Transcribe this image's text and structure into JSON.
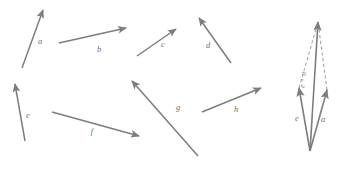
{
  "figure": {
    "stroke_color": "#7d7d7d",
    "dashed_color": "#9a9a9a",
    "label_color": "#6f6f6f",
    "background": "#ffffff",
    "width": 341,
    "height": 169
  },
  "left_panel": {
    "name": "labeled-vectors-group",
    "vectors": [
      {
        "id": "a",
        "label": "a",
        "x1": 22,
        "y1": 68,
        "x2": 43,
        "y2": 10,
        "lx": 40,
        "ly": 44
      },
      {
        "id": "b",
        "label": "b",
        "x1": 59,
        "y1": 43,
        "x2": 126,
        "y2": 28,
        "lx": 99,
        "ly": 52
      },
      {
        "id": "c",
        "label": "c",
        "x1": 137,
        "y1": 56,
        "x2": 176,
        "y2": 29,
        "lx": 163,
        "ly": 47
      },
      {
        "id": "d",
        "label": "d",
        "x1": 231,
        "y1": 63,
        "x2": 199,
        "y2": 18,
        "lx": 208,
        "ly": 48
      },
      {
        "id": "e",
        "label": "e",
        "x1": 25,
        "y1": 141,
        "x2": 15,
        "y2": 84,
        "lx": 28,
        "ly": 118
      },
      {
        "id": "f",
        "label": "f",
        "x1": 52,
        "y1": 112,
        "x2": 139,
        "y2": 136,
        "lx": 92,
        "ly": 134
      },
      {
        "id": "g",
        "label": "g",
        "x1": 198,
        "y1": 156,
        "x2": 132,
        "y2": 81,
        "lx": 178,
        "ly": 110
      },
      {
        "id": "h",
        "label": "h",
        "x1": 202,
        "y1": 112,
        "x2": 261,
        "y2": 88,
        "lx": 236,
        "ly": 112
      }
    ]
  },
  "right_panel": {
    "name": "parallelogram-sum-group",
    "origin": {
      "x": 310,
      "y": 151
    },
    "apex": {
      "x": 318,
      "y": 22
    },
    "tip_e": {
      "x": 299,
      "y": 88
    },
    "tip_a": {
      "x": 327,
      "y": 90
    },
    "solid_vectors": [
      {
        "id": "e",
        "label": "e",
        "x1": 310,
        "y1": 151,
        "x2": 299,
        "y2": 88,
        "lx": 297,
        "ly": 121
      },
      {
        "id": "a",
        "label": "a",
        "x1": 310,
        "y1": 151,
        "x2": 327,
        "y2": 90,
        "lx": 323,
        "ly": 122
      },
      {
        "id": "sum",
        "label": "e + a",
        "x1": 310,
        "y1": 151,
        "x2": 318,
        "y2": 22,
        "lx": 305,
        "ly": 80
      }
    ],
    "dashed_edges": [
      {
        "id": "dash-e-to-apex",
        "x1": 299,
        "y1": 88,
        "x2": 318,
        "y2": 22
      },
      {
        "id": "dash-a-to-apex",
        "x1": 327,
        "y1": 90,
        "x2": 318,
        "y2": 22
      }
    ],
    "sum_label": "e + a"
  }
}
